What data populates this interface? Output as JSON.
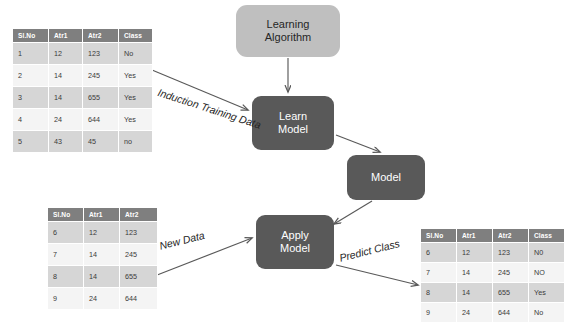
{
  "diagram": {
    "colors": {
      "node_light_bg": "#bfbfbf",
      "node_dark_bg": "#595959",
      "node_dark_text": "#ffffff",
      "table_header_bg": "#7f7f7f",
      "table_row_odd_bg": "#d6d6d6",
      "table_row_even_bg": "#f4f4f4",
      "arrow": "#595959",
      "background": "#ffffff"
    }
  },
  "nodes": {
    "learning_algorithm": "Learning Algorithm",
    "learning_algorithm_line1": "Learning",
    "learning_algorithm_line2": "Algorithm",
    "learn_model_line1": "Learn",
    "learn_model_line2": "Model",
    "model": "Model",
    "apply_model_line1": "Apply",
    "apply_model_line2": "Model"
  },
  "edge_labels": {
    "induction_line1": "Induction",
    "induction_line2": "Training Data",
    "new_data": "New Data",
    "predict_class": "Predict Class"
  },
  "tables": {
    "training": {
      "name": "Training Set",
      "columns": [
        "Sl.No",
        "Atr1",
        "Atr2",
        "Class"
      ],
      "rows": [
        [
          "1",
          "12",
          "123",
          "No"
        ],
        [
          "2",
          "14",
          "245",
          "Yes"
        ],
        [
          "3",
          "14",
          "655",
          "Yes"
        ],
        [
          "4",
          "24",
          "644",
          "Yes"
        ],
        [
          "5",
          "43",
          "45",
          "no"
        ]
      ]
    },
    "new_data": {
      "name": "New Data",
      "columns": [
        "Sl.No",
        "Atr1",
        "Atr2"
      ],
      "rows": [
        [
          "6",
          "12",
          "123"
        ],
        [
          "7",
          "14",
          "245"
        ],
        [
          "8",
          "14",
          "655"
        ],
        [
          "9",
          "24",
          "644"
        ]
      ]
    },
    "predicted": {
      "name": "Predicted Class",
      "columns": [
        "Sl.No",
        "Atr1",
        "Atr2",
        "Class"
      ],
      "rows": [
        [
          "6",
          "12",
          "123",
          "N0"
        ],
        [
          "7",
          "14",
          "245",
          "NO"
        ],
        [
          "8",
          "14",
          "655",
          "Yes"
        ],
        [
          "9",
          "24",
          "644",
          "No"
        ]
      ]
    }
  }
}
